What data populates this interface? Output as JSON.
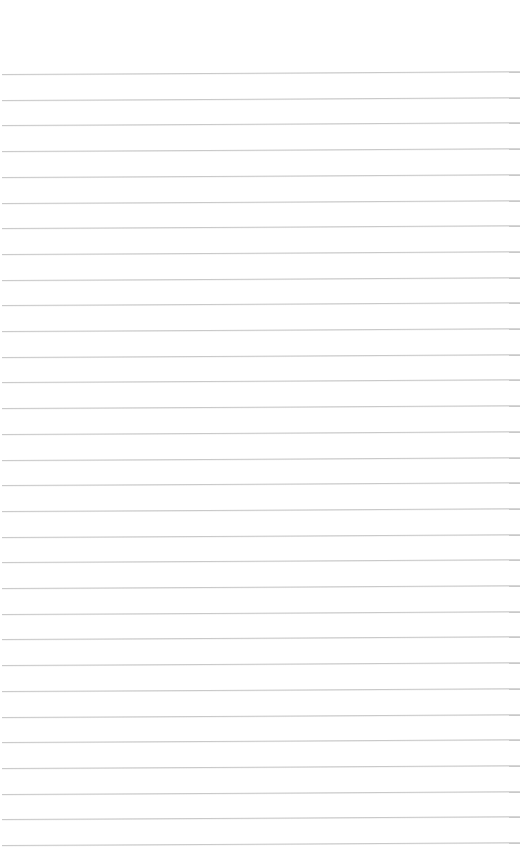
{
  "page": {
    "type": "lined-paper",
    "background_color": "#ffffff",
    "line_color": "#c9c9c9",
    "line_count": 31,
    "first_line_y": 74,
    "line_spacing": 25.7,
    "text_content": ""
  }
}
